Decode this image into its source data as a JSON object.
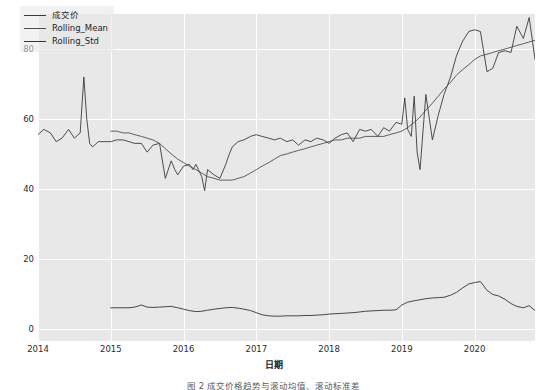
{
  "chart_data": {
    "type": "line",
    "title": "",
    "xlabel": "日期",
    "ylabel": "",
    "xlim": [
      2014.0,
      2020.83
    ],
    "ylim": [
      -3.5,
      90.0
    ],
    "grid": true,
    "legend_position": "upper left",
    "yticks": [
      0,
      20,
      40,
      60,
      80
    ],
    "ytick_labels": [
      "0",
      "20",
      "40",
      "60",
      "80"
    ],
    "xticks": [
      2014,
      2015,
      2016,
      2017,
      2018,
      2019,
      2020
    ],
    "xtick_labels": [
      "2014",
      "2015",
      "2016",
      "2017",
      "2018",
      "2019",
      "2020"
    ],
    "colors": {
      "成交价": "#3b3b3b",
      "Rolling_Mean": "#4e4e4e",
      "Rolling_Std": "#333333",
      "plot_background": "#e8e8e8",
      "gridline": "#ffffff",
      "figure_background": "#ffffff",
      "tick_text": "#2b2b2b"
    },
    "series": [
      {
        "name": "成交价",
        "x": [
          2014.0,
          2014.08,
          2014.17,
          2014.25,
          2014.33,
          2014.42,
          2014.5,
          2014.58,
          2014.63,
          2014.67,
          2014.71,
          2014.75,
          2014.83,
          2014.92,
          2015.0,
          2015.08,
          2015.17,
          2015.25,
          2015.33,
          2015.42,
          2015.5,
          2015.58,
          2015.67,
          2015.75,
          2015.83,
          2015.88,
          2015.92,
          2016.0,
          2016.08,
          2016.13,
          2016.17,
          2016.25,
          2016.29,
          2016.33,
          2016.42,
          2016.5,
          2016.58,
          2016.63,
          2016.67,
          2016.75,
          2016.83,
          2016.92,
          2017.0,
          2017.08,
          2017.17,
          2017.25,
          2017.33,
          2017.42,
          2017.5,
          2017.58,
          2017.67,
          2017.75,
          2017.83,
          2017.92,
          2018.0,
          2018.08,
          2018.17,
          2018.25,
          2018.33,
          2018.42,
          2018.5,
          2018.58,
          2018.67,
          2018.75,
          2018.83,
          2018.92,
          2019.0,
          2019.04,
          2019.08,
          2019.13,
          2019.17,
          2019.21,
          2019.25,
          2019.33,
          2019.42,
          2019.5,
          2019.58,
          2019.67,
          2019.75,
          2019.83,
          2019.92,
          2020.0,
          2020.08,
          2020.17,
          2020.25,
          2020.33,
          2020.42,
          2020.5,
          2020.58,
          2020.67,
          2020.75,
          2020.83
        ],
        "values": [
          55.5,
          57.0,
          56.0,
          53.5,
          54.5,
          57.0,
          54.5,
          56.0,
          72.0,
          60.0,
          53.0,
          52.0,
          53.5,
          53.5,
          53.5,
          54.0,
          54.0,
          53.5,
          53.0,
          53.0,
          50.5,
          52.5,
          53.0,
          43.0,
          48.0,
          45.5,
          44.0,
          46.5,
          47.0,
          45.5,
          47.0,
          43.5,
          39.5,
          45.5,
          44.0,
          43.0,
          47.0,
          50.0,
          52.0,
          53.5,
          54.0,
          55.0,
          55.5,
          55.0,
          54.5,
          54.0,
          54.5,
          53.5,
          54.0,
          52.5,
          54.0,
          53.5,
          54.5,
          54.0,
          53.0,
          54.5,
          55.5,
          56.0,
          53.5,
          57.0,
          56.5,
          57.0,
          55.0,
          57.5,
          56.5,
          59.0,
          58.5,
          66.0,
          57.0,
          55.0,
          66.5,
          50.5,
          45.5,
          67.0,
          54.0,
          61.0,
          67.0,
          72.0,
          78.0,
          82.0,
          85.0,
          85.5,
          85.0,
          73.5,
          74.5,
          79.0,
          79.5,
          79.0,
          86.5,
          83.0,
          89.0,
          77.0
        ]
      },
      {
        "name": "Rolling_Mean",
        "x": [
          2015.0,
          2015.08,
          2015.17,
          2015.25,
          2015.33,
          2015.42,
          2015.5,
          2015.58,
          2015.67,
          2015.75,
          2015.83,
          2015.92,
          2016.0,
          2016.08,
          2016.17,
          2016.25,
          2016.33,
          2016.42,
          2016.5,
          2016.58,
          2016.67,
          2016.75,
          2016.83,
          2016.92,
          2017.0,
          2017.08,
          2017.17,
          2017.25,
          2017.33,
          2017.42,
          2017.5,
          2017.58,
          2017.67,
          2017.75,
          2017.83,
          2017.92,
          2018.0,
          2018.08,
          2018.17,
          2018.25,
          2018.33,
          2018.42,
          2018.5,
          2018.58,
          2018.67,
          2018.75,
          2018.83,
          2018.92,
          2019.0,
          2019.08,
          2019.17,
          2019.25,
          2019.33,
          2019.42,
          2019.5,
          2019.58,
          2019.67,
          2019.75,
          2019.83,
          2019.92,
          2020.0,
          2020.08,
          2020.17,
          2020.25,
          2020.33,
          2020.42,
          2020.5,
          2020.58,
          2020.67,
          2020.75,
          2020.83
        ],
        "values": [
          56.5,
          56.5,
          56.0,
          56.0,
          55.5,
          55.0,
          54.5,
          54.0,
          53.0,
          51.5,
          50.0,
          48.5,
          47.5,
          46.5,
          45.5,
          44.5,
          43.5,
          43.0,
          42.5,
          42.5,
          42.5,
          43.0,
          43.5,
          44.5,
          45.5,
          46.5,
          47.5,
          48.5,
          49.5,
          50.0,
          50.5,
          51.0,
          51.5,
          52.0,
          52.5,
          53.0,
          53.5,
          54.0,
          54.0,
          54.5,
          54.5,
          54.5,
          55.0,
          55.0,
          55.0,
          55.0,
          55.5,
          56.0,
          56.5,
          57.5,
          59.0,
          60.5,
          62.5,
          64.5,
          66.5,
          68.5,
          70.5,
          72.5,
          74.0,
          75.5,
          77.0,
          78.0,
          78.5,
          79.0,
          79.5,
          80.0,
          80.5,
          81.0,
          81.5,
          82.0,
          82.5
        ]
      },
      {
        "name": "Rolling_Std",
        "x": [
          2015.0,
          2015.08,
          2015.17,
          2015.25,
          2015.33,
          2015.42,
          2015.5,
          2015.58,
          2015.67,
          2015.75,
          2015.83,
          2015.92,
          2016.0,
          2016.08,
          2016.17,
          2016.25,
          2016.33,
          2016.42,
          2016.5,
          2016.58,
          2016.67,
          2016.75,
          2016.83,
          2016.92,
          2017.0,
          2017.08,
          2017.17,
          2017.25,
          2017.33,
          2017.42,
          2017.5,
          2017.58,
          2017.67,
          2017.75,
          2017.83,
          2017.92,
          2018.0,
          2018.08,
          2018.17,
          2018.25,
          2018.33,
          2018.42,
          2018.5,
          2018.58,
          2018.67,
          2018.75,
          2018.83,
          2018.92,
          2019.0,
          2019.08,
          2019.17,
          2019.25,
          2019.33,
          2019.42,
          2019.5,
          2019.58,
          2019.67,
          2019.75,
          2019.83,
          2019.92,
          2020.0,
          2020.08,
          2020.17,
          2020.25,
          2020.33,
          2020.42,
          2020.5,
          2020.58,
          2020.67,
          2020.75,
          2020.83
        ],
        "values": [
          6.0,
          6.0,
          6.0,
          6.0,
          6.2,
          6.8,
          6.2,
          6.1,
          6.2,
          6.3,
          6.4,
          6.0,
          5.6,
          5.2,
          4.9,
          5.0,
          5.3,
          5.6,
          5.8,
          6.0,
          6.1,
          5.9,
          5.6,
          5.2,
          4.6,
          4.0,
          3.7,
          3.6,
          3.6,
          3.7,
          3.7,
          3.7,
          3.8,
          3.8,
          3.9,
          4.0,
          4.2,
          4.3,
          4.4,
          4.5,
          4.6,
          4.8,
          5.0,
          5.1,
          5.2,
          5.3,
          5.3,
          5.4,
          6.8,
          7.6,
          8.0,
          8.3,
          8.6,
          8.8,
          8.9,
          9.0,
          9.6,
          10.4,
          11.6,
          12.8,
          13.2,
          13.5,
          11.0,
          9.8,
          9.4,
          8.4,
          7.2,
          6.4,
          6.0,
          6.6,
          5.2
        ]
      }
    ]
  },
  "legend": {
    "items": [
      {
        "label": "成交价",
        "color": "#3b3b3b"
      },
      {
        "label": "Rolling_Mean",
        "color": "#4e4e4e"
      },
      {
        "label": "Rolling_Std",
        "color": "#333333"
      }
    ]
  },
  "axes": {
    "x_title": "日期"
  },
  "caption": {
    "text": "图 2  成交价格趋势与滚动均值、滚动标准差"
  }
}
